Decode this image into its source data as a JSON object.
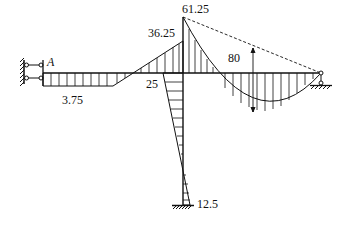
{
  "diagram": {
    "type": "bending-moment-diagram",
    "point_label": "A",
    "values": {
      "left_beam_constant": "3.75",
      "joint_beam_left": "36.25",
      "joint_peak": "61.25",
      "column_top": "25",
      "midspan_sag": "80",
      "column_base": "12.5"
    }
  }
}
